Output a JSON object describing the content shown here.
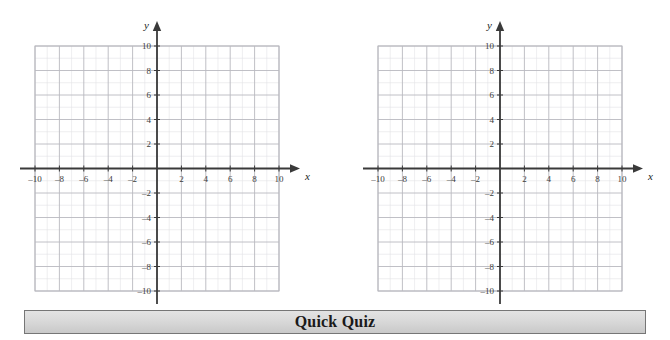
{
  "page": {
    "background_color": "#ffffff",
    "width": 670,
    "height": 340
  },
  "banner": {
    "title": "Quick Quiz",
    "background_color": "#d9d9d9",
    "border_color": "#767676",
    "text_color": "#1a1a1a"
  },
  "chart_data": [
    {
      "id": "coordinate-grid-left",
      "type": "scatter",
      "title": "",
      "xlabel": "x",
      "ylabel": "y",
      "xlim": [
        -10,
        10
      ],
      "ylim": [
        -10,
        10
      ],
      "xticks": [
        -10,
        -8,
        -6,
        -4,
        -2,
        2,
        4,
        6,
        8,
        10
      ],
      "yticks": [
        10,
        8,
        6,
        4,
        2,
        -2,
        -4,
        -6,
        -8,
        -10
      ],
      "xtick_labels": [
        "–10",
        "–8",
        "–6",
        "–4",
        "–2",
        "2",
        "4",
        "6",
        "8",
        "10"
      ],
      "ytick_labels": [
        "10",
        "8",
        "6",
        "4",
        "2",
        "–2",
        "–4",
        "–6",
        "–8",
        "–10"
      ],
      "grid": true,
      "minor_grid_step": 1,
      "major_grid_step": 2,
      "minor_grid_color": "#e2e2e6",
      "major_grid_color": "#b9b9bf",
      "axis_color": "#3a3a3a",
      "legend": "none",
      "series": [],
      "x": [],
      "values": []
    },
    {
      "id": "coordinate-grid-right",
      "type": "scatter",
      "title": "",
      "xlabel": "x",
      "ylabel": "y",
      "xlim": [
        -10,
        10
      ],
      "ylim": [
        -10,
        10
      ],
      "xticks": [
        -10,
        -8,
        -6,
        -4,
        -2,
        2,
        4,
        6,
        8,
        10
      ],
      "yticks": [
        10,
        8,
        6,
        4,
        2,
        -2,
        -4,
        -6,
        -8,
        -10
      ],
      "xtick_labels": [
        "–10",
        "–8",
        "–6",
        "–4",
        "–2",
        "2",
        "4",
        "6",
        "8",
        "10"
      ],
      "ytick_labels": [
        "10",
        "8",
        "6",
        "4",
        "2",
        "–2",
        "–4",
        "–6",
        "–8",
        "–10"
      ],
      "grid": true,
      "minor_grid_step": 1,
      "major_grid_step": 2,
      "minor_grid_color": "#e2e2e6",
      "major_grid_color": "#b9b9bf",
      "axis_color": "#3a3a3a",
      "legend": "none",
      "series": [],
      "x": [],
      "values": []
    }
  ]
}
